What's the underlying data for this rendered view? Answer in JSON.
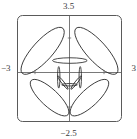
{
  "figure": {
    "kind": "polar-rose-curve-plot",
    "frame_color": "#5a5a5a",
    "axis_color": "#6a6a6a",
    "curve_color": "#2b2b2b",
    "background": "#ffffff"
  },
  "axis_labels": {
    "top": "3.5",
    "bottom": "−2.5",
    "left": "−3",
    "right": "3"
  },
  "chart_data": {
    "type": "line",
    "title": "",
    "xlabel": "",
    "ylabel": "",
    "xlim": [
      -3,
      3
    ],
    "ylim": [
      -2.5,
      3.5
    ],
    "grid": false,
    "legend": null,
    "xticklabels": [
      "−3",
      "3"
    ],
    "yticklabels": [
      "3.5",
      "−2.5"
    ],
    "series": [
      {
        "name": "petal-upper-left",
        "description": "large elongated loop from origin toward upper-left",
        "center": [
          -1.55,
          1.5
        ],
        "rotation_deg": -48,
        "semi_major": 1.75,
        "semi_minor": 0.58
      },
      {
        "name": "petal-upper-right",
        "description": "large elongated loop from origin toward upper-right",
        "center": [
          1.55,
          1.5
        ],
        "rotation_deg": 48,
        "semi_major": 1.75,
        "semi_minor": 0.58
      },
      {
        "name": "petal-lower-left",
        "description": "large elongated loop from origin toward lower-left",
        "center": [
          -1.15,
          -1.15
        ],
        "rotation_deg": 43,
        "semi_major": 1.45,
        "semi_minor": 0.5
      },
      {
        "name": "petal-lower-right",
        "description": "large elongated loop from origin toward lower-right",
        "center": [
          1.15,
          -1.15
        ],
        "rotation_deg": -43,
        "semi_major": 1.45,
        "semi_minor": 0.5
      },
      {
        "name": "petal-vertical-up",
        "description": "narrow vertical loop rising from origin",
        "center": [
          0.02,
          0.95
        ],
        "rotation_deg": 0,
        "semi_major": 1.0,
        "semi_minor": 0.16
      },
      {
        "name": "petal-horizontal-left",
        "description": "thin flat loop along negative x axis",
        "center": [
          -0.62,
          0.0
        ],
        "rotation_deg": 90,
        "semi_major": 0.62,
        "semi_minor": 0.07
      },
      {
        "name": "petal-horizontal-right",
        "description": "thin flat loop along positive x axis",
        "center": [
          0.62,
          0.0
        ],
        "rotation_deg": 90,
        "semi_major": 0.62,
        "semi_minor": 0.07
      },
      {
        "name": "petal-down-left-small",
        "description": "small slim loop pointing down-left",
        "center": [
          -0.38,
          -0.3
        ],
        "rotation_deg": 52,
        "semi_major": 0.48,
        "semi_minor": 0.07
      },
      {
        "name": "petal-down-right-small",
        "description": "small slim loop pointing down-right",
        "center": [
          0.38,
          -0.3
        ],
        "rotation_deg": -52,
        "semi_major": 0.48,
        "semi_minor": 0.07
      },
      {
        "name": "petal-down-center-small",
        "description": "small slim loop pointing straight down",
        "center": [
          0.0,
          -0.42
        ],
        "rotation_deg": 0,
        "semi_major": 0.45,
        "semi_minor": 0.07
      }
    ]
  }
}
